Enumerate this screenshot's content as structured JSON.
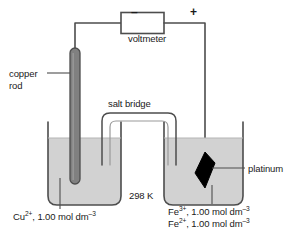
{
  "diagram": {
    "temperature": "298 K",
    "colors": {
      "solution": "#d2d2d2",
      "copper_rod": "#808080",
      "platinum": "#000000",
      "outline": "#4d4d4d",
      "text": "#1a1a1a",
      "background": "#ffffff"
    },
    "labels": {
      "copper_rod_line1": "copper",
      "copper_rod_line2": "rod",
      "voltmeter": "voltmeter",
      "salt_bridge": "salt bridge",
      "platinum": "platinum",
      "terminal_negative": "–",
      "terminal_positive": "+"
    },
    "left_half_cell": {
      "electrode": "copper rod",
      "solution_species": "Cu",
      "solution_charge": "2+",
      "solution_concentration": "1.00 mol dm",
      "solution_exponent": "–3",
      "solution_text": "Cu2+, 1.00 mol dm-3"
    },
    "right_half_cell": {
      "electrode": "platinum",
      "line1_species": "Fe",
      "line1_charge": "3+",
      "line1_concentration": "1.00 mol dm",
      "line1_exponent": "–3",
      "line2_species": "Fe",
      "line2_charge": "2+",
      "line2_concentration": "1.00 mol dm",
      "line2_exponent": "–3"
    }
  }
}
